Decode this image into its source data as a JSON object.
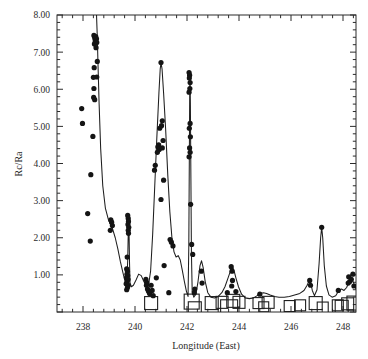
{
  "chart_data": {
    "type": "scatter",
    "title": "",
    "xlabel": "Longitude (East)",
    "ylabel": "Rc/Ra",
    "xlim": [
      237.0,
      248.5
    ],
    "ylim": [
      0.0,
      8.0
    ],
    "xticks": [
      238,
      240,
      242,
      244,
      246,
      248
    ],
    "xticklabels": [
      "238",
      "240",
      "242",
      "244",
      "246",
      "248"
    ],
    "yticks": [
      1.0,
      2.0,
      3.0,
      4.0,
      5.0,
      6.0,
      7.0,
      8.0
    ],
    "yticklabels": [
      "1.00",
      "2.00",
      "3.00",
      "4.00",
      "5.00",
      "6.00",
      "7.00",
      "8.00"
    ],
    "x_minor_per_major": 5,
    "y_minor_per_major": 5,
    "grid": false,
    "legend": null,
    "series": [
      {
        "name": "Rc/Ra measurements",
        "marker": "filled-circle",
        "type": "scatter",
        "points": [
          [
            237.95,
            5.48
          ],
          [
            237.98,
            5.08
          ],
          [
            238.18,
            2.65
          ],
          [
            238.28,
            1.91
          ],
          [
            238.42,
            7.45
          ],
          [
            238.45,
            7.38
          ],
          [
            238.47,
            7.3
          ],
          [
            238.44,
            7.22
          ],
          [
            238.49,
            7.42
          ],
          [
            238.52,
            7.36
          ],
          [
            238.5,
            7.12
          ],
          [
            238.53,
            7.26
          ],
          [
            238.55,
            6.75
          ],
          [
            238.43,
            6.58
          ],
          [
            238.4,
            6.32
          ],
          [
            238.53,
            6.33
          ],
          [
            238.42,
            6.02
          ],
          [
            238.41,
            5.78
          ],
          [
            238.45,
            5.72
          ],
          [
            238.38,
            4.73
          ],
          [
            238.3,
            3.7
          ],
          [
            239.07,
            2.48
          ],
          [
            239.1,
            2.42
          ],
          [
            239.13,
            2.33
          ],
          [
            239.05,
            2.2
          ],
          [
            239.72,
            2.6
          ],
          [
            239.74,
            2.52
          ],
          [
            239.75,
            2.44
          ],
          [
            239.73,
            2.36
          ],
          [
            239.76,
            2.28
          ],
          [
            239.74,
            2.2
          ],
          [
            239.75,
            2.12
          ],
          [
            239.7,
            1.48
          ],
          [
            239.68,
            1.16
          ],
          [
            239.71,
            1.1
          ],
          [
            239.69,
            1.02
          ],
          [
            239.72,
            0.98
          ],
          [
            239.67,
            0.92
          ],
          [
            239.73,
            0.88
          ],
          [
            239.7,
            0.82
          ],
          [
            239.66,
            0.76
          ],
          [
            239.74,
            0.72
          ],
          [
            239.71,
            0.66
          ],
          [
            239.68,
            0.6
          ],
          [
            240.42,
            0.88
          ],
          [
            240.45,
            0.8
          ],
          [
            240.44,
            0.72
          ],
          [
            240.48,
            0.62
          ],
          [
            240.52,
            0.56
          ],
          [
            240.56,
            0.5
          ],
          [
            240.62,
            0.72
          ],
          [
            240.66,
            0.58
          ],
          [
            240.7,
            0.44
          ],
          [
            240.82,
            0.92
          ],
          [
            240.75,
            3.82
          ],
          [
            240.78,
            3.95
          ],
          [
            240.88,
            4.45
          ],
          [
            240.91,
            4.5
          ],
          [
            240.93,
            4.38
          ],
          [
            240.86,
            4.3
          ],
          [
            240.95,
            4.95
          ],
          [
            241.0,
            6.72
          ],
          [
            241.05,
            5.15
          ],
          [
            241.02,
            5.02
          ],
          [
            241.08,
            4.62
          ],
          [
            241.05,
            4.42
          ],
          [
            241.1,
            3.55
          ],
          [
            241.0,
            3.03
          ],
          [
            241.12,
            1.25
          ],
          [
            241.35,
            1.95
          ],
          [
            241.4,
            1.88
          ],
          [
            241.46,
            1.78
          ],
          [
            241.3,
            0.52
          ],
          [
            242.08,
            6.45
          ],
          [
            242.1,
            6.38
          ],
          [
            242.09,
            6.3
          ],
          [
            242.12,
            6.18
          ],
          [
            242.11,
            6.02
          ],
          [
            242.08,
            5.92
          ],
          [
            242.12,
            5.08
          ],
          [
            242.09,
            4.95
          ],
          [
            242.13,
            4.72
          ],
          [
            242.1,
            4.42
          ],
          [
            242.12,
            4.3
          ],
          [
            242.08,
            4.18
          ],
          [
            242.14,
            2.9
          ],
          [
            242.18,
            1.82
          ],
          [
            242.22,
            1.55
          ],
          [
            242.3,
            0.62
          ],
          [
            242.28,
            0.52
          ],
          [
            242.55,
            1.1
          ],
          [
            242.58,
            0.78
          ],
          [
            243.7,
            1.22
          ],
          [
            243.73,
            1.1
          ],
          [
            243.75,
            0.85
          ],
          [
            243.72,
            0.7
          ],
          [
            243.55,
            0.52
          ],
          [
            243.88,
            0.55
          ],
          [
            244.8,
            0.48
          ],
          [
            246.72,
            0.85
          ],
          [
            246.75,
            0.72
          ],
          [
            247.18,
            2.28
          ],
          [
            247.82,
            0.58
          ],
          [
            248.22,
            0.95
          ],
          [
            248.26,
            0.82
          ],
          [
            248.2,
            0.78
          ],
          [
            248.32,
            0.88
          ],
          [
            248.38,
            1.02
          ],
          [
            248.42,
            0.7
          ]
        ]
      },
      {
        "name": "Open square markers (baseline)",
        "marker": "open-square",
        "type": "scatter",
        "points": [
          [
            240.62,
            0.24,
            13
          ],
          [
            242.18,
            0.28,
            15
          ],
          [
            242.3,
            0.1,
            13
          ],
          [
            242.95,
            0.24,
            13
          ],
          [
            243.35,
            0.26,
            12
          ],
          [
            243.62,
            0.1,
            17
          ],
          [
            243.78,
            0.3,
            13
          ],
          [
            244.0,
            0.26,
            12
          ],
          [
            244.75,
            0.24,
            11
          ],
          [
            244.95,
            0.14,
            10
          ],
          [
            245.12,
            0.26,
            12
          ],
          [
            245.95,
            0.16,
            11
          ],
          [
            246.35,
            0.18,
            11
          ],
          [
            246.95,
            0.24,
            13
          ],
          [
            247.22,
            0.12,
            11
          ],
          [
            247.8,
            0.18,
            11
          ],
          [
            247.95,
            0.14,
            13
          ],
          [
            248.18,
            0.22,
            12
          ],
          [
            248.42,
            0.24,
            14
          ]
        ]
      }
    ],
    "curve": {
      "name": "Model fit curve",
      "style": "solid",
      "points": [
        [
          238.52,
          8.0
        ],
        [
          238.55,
          7.4
        ],
        [
          238.58,
          6.6
        ],
        [
          238.62,
          5.6
        ],
        [
          238.68,
          4.4
        ],
        [
          238.76,
          3.4
        ],
        [
          238.86,
          2.8
        ],
        [
          238.98,
          2.48
        ],
        [
          239.12,
          2.28
        ],
        [
          239.24,
          2.0
        ],
        [
          239.34,
          1.7
        ],
        [
          239.44,
          1.35
        ],
        [
          239.54,
          1.05
        ],
        [
          239.62,
          0.82
        ],
        [
          239.68,
          0.72
        ],
        [
          239.72,
          1.4
        ],
        [
          239.745,
          2.3
        ],
        [
          239.755,
          2.58
        ],
        [
          239.77,
          2.2
        ],
        [
          239.79,
          1.3
        ],
        [
          239.81,
          0.78
        ],
        [
          239.86,
          0.68
        ],
        [
          239.94,
          0.72
        ],
        [
          240.04,
          0.86
        ],
        [
          240.14,
          1.02
        ],
        [
          240.24,
          0.98
        ],
        [
          240.34,
          0.82
        ],
        [
          240.44,
          0.7
        ],
        [
          240.52,
          0.72
        ],
        [
          240.6,
          1.1
        ],
        [
          240.68,
          2.1
        ],
        [
          240.76,
          3.4
        ],
        [
          240.84,
          4.7
        ],
        [
          240.92,
          5.9
        ],
        [
          240.97,
          6.55
        ],
        [
          241.0,
          6.72
        ],
        [
          241.04,
          6.55
        ],
        [
          241.1,
          5.9
        ],
        [
          241.18,
          4.9
        ],
        [
          241.26,
          3.7
        ],
        [
          241.34,
          2.7
        ],
        [
          241.42,
          2.0
        ],
        [
          241.5,
          1.62
        ],
        [
          241.58,
          1.48
        ],
        [
          241.66,
          1.52
        ],
        [
          241.74,
          1.4
        ],
        [
          241.82,
          1.12
        ],
        [
          241.9,
          0.82
        ],
        [
          241.98,
          0.55
        ],
        [
          242.04,
          0.42
        ],
        [
          242.07,
          1.8
        ],
        [
          242.09,
          4.2
        ],
        [
          242.105,
          6.0
        ],
        [
          242.115,
          6.48
        ],
        [
          242.13,
          5.6
        ],
        [
          242.15,
          3.6
        ],
        [
          242.17,
          1.6
        ],
        [
          242.2,
          0.55
        ],
        [
          242.26,
          0.4
        ],
        [
          242.34,
          0.48
        ],
        [
          242.42,
          0.8
        ],
        [
          242.5,
          1.25
        ],
        [
          242.56,
          1.38
        ],
        [
          242.62,
          1.2
        ],
        [
          242.7,
          0.82
        ],
        [
          242.8,
          0.52
        ],
        [
          242.92,
          0.4
        ],
        [
          243.06,
          0.38
        ],
        [
          243.2,
          0.42
        ],
        [
          243.34,
          0.52
        ],
        [
          243.46,
          0.68
        ],
        [
          243.58,
          0.92
        ],
        [
          243.68,
          1.12
        ],
        [
          243.74,
          1.22
        ],
        [
          243.8,
          1.14
        ],
        [
          243.88,
          0.92
        ],
        [
          243.98,
          0.68
        ],
        [
          244.1,
          0.48
        ],
        [
          244.24,
          0.38
        ],
        [
          244.4,
          0.36
        ],
        [
          244.56,
          0.38
        ],
        [
          244.7,
          0.44
        ],
        [
          244.82,
          0.5
        ],
        [
          244.94,
          0.52
        ],
        [
          245.06,
          0.5
        ],
        [
          245.2,
          0.46
        ],
        [
          245.36,
          0.42
        ],
        [
          245.54,
          0.4
        ],
        [
          245.74,
          0.4
        ],
        [
          245.94,
          0.42
        ],
        [
          246.14,
          0.46
        ],
        [
          246.34,
          0.5
        ],
        [
          246.5,
          0.58
        ],
        [
          246.62,
          0.72
        ],
        [
          246.7,
          0.84
        ],
        [
          246.76,
          0.78
        ],
        [
          246.82,
          0.58
        ],
        [
          246.9,
          0.44
        ],
        [
          247.0,
          0.6
        ],
        [
          247.08,
          1.3
        ],
        [
          247.14,
          2.0
        ],
        [
          247.18,
          2.28
        ],
        [
          247.22,
          2.0
        ],
        [
          247.28,
          1.25
        ],
        [
          247.36,
          0.7
        ],
        [
          247.46,
          0.46
        ],
        [
          247.58,
          0.4
        ],
        [
          247.72,
          0.44
        ],
        [
          247.84,
          0.58
        ],
        [
          247.94,
          0.62
        ],
        [
          248.04,
          0.58
        ],
        [
          248.14,
          0.66
        ],
        [
          248.24,
          0.82
        ],
        [
          248.32,
          0.9
        ],
        [
          248.4,
          0.8
        ],
        [
          248.46,
          0.68
        ],
        [
          248.5,
          0.62
        ]
      ]
    }
  },
  "figure": {
    "plot_left_px": 57,
    "plot_right_px": 356,
    "plot_top_px": 15,
    "plot_bottom_px": 312
  }
}
